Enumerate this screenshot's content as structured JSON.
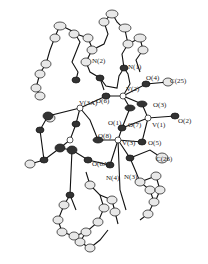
{
  "figure": {
    "type": "ORTEP crystal structure",
    "atom_labels": [
      {
        "id": "N2",
        "text": "N(2)",
        "x": 97,
        "y": 62
      },
      {
        "id": "N1",
        "text": "N(1)",
        "x": 131,
        "y": 69
      },
      {
        "id": "O4",
        "text": "O(4)",
        "x": 147,
        "y": 80
      },
      {
        "id": "C25",
        "text": "C(25)",
        "x": 171,
        "y": 80
      },
      {
        "id": "V2",
        "text": "V(2)",
        "x": 125,
        "y": 91
      },
      {
        "id": "V3A",
        "text": "V(3A)",
        "x": 80,
        "y": 100
      },
      {
        "id": "O6",
        "text": "O(6)",
        "x": 97,
        "y": 97
      },
      {
        "id": "O3",
        "text": "O(3)",
        "x": 155,
        "y": 102
      },
      {
        "id": "O1",
        "text": "O(1)",
        "x": 109,
        "y": 121
      },
      {
        "id": "O7",
        "text": "O(7)",
        "x": 130,
        "y": 121
      },
      {
        "id": "V1",
        "text": "V(1)",
        "x": 155,
        "y": 121
      },
      {
        "id": "O2",
        "text": "O(2)",
        "x": 180,
        "y": 118
      },
      {
        "id": "O8",
        "text": "O(8)",
        "x": 99,
        "y": 133
      },
      {
        "id": "V3",
        "text": "V(3)",
        "x": 124,
        "y": 140
      },
      {
        "id": "O5",
        "text": "O(5)",
        "x": 149,
        "y": 141
      },
      {
        "id": "C26",
        "text": "C(26)",
        "x": 158,
        "y": 155
      },
      {
        "id": "O6A",
        "text": "O(6A)",
        "x": 92,
        "y": 160
      },
      {
        "id": "N4",
        "text": "N(4)",
        "x": 106,
        "y": 176
      },
      {
        "id": "N3",
        "text": "N(3)",
        "x": 124,
        "y": 174
      }
    ]
  }
}
